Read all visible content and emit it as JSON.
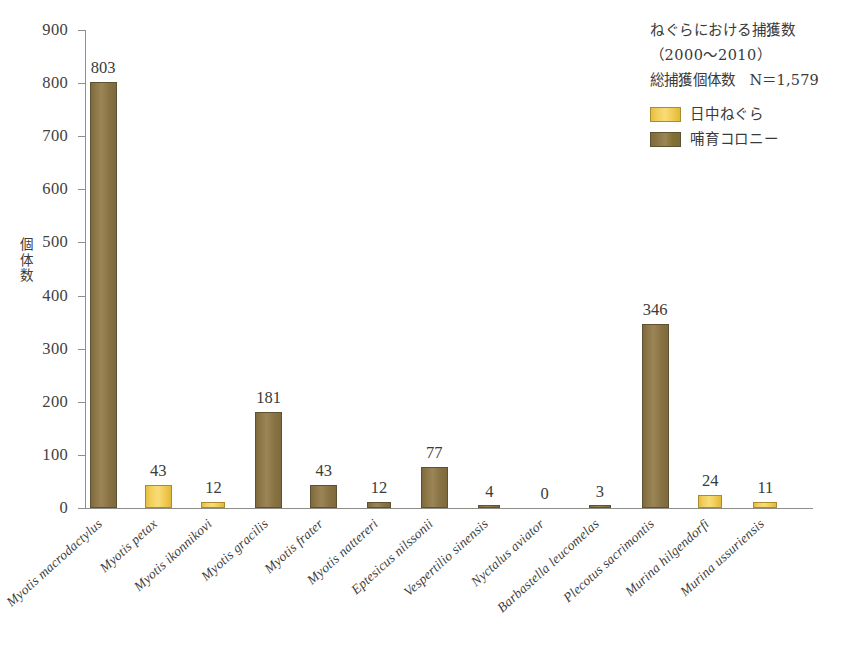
{
  "chart_data": {
    "type": "bar",
    "title": "",
    "xlabel": "",
    "ylabel": "個体数",
    "ylim": [
      0,
      900
    ],
    "ytick_step": 100,
    "yticks": [
      900,
      800,
      700,
      600,
      500,
      400,
      300,
      200,
      100,
      0
    ],
    "grid": false,
    "legend_position": "top-right",
    "categories": [
      "Myotis macrodactylus",
      "Myotis petax",
      "Myotis ikonnikovi",
      "Myotis gracilis",
      "Myotis frater",
      "Myotis nattereri",
      "Eptesicus nilssonii",
      "Vespertilio sinensis",
      "Nyctalus aviator",
      "Barbastella leucomelas",
      "Plecotus sacrimontis",
      "Murina hilgendorfi",
      "Murina ussuriensis"
    ],
    "values": [
      803,
      43,
      12,
      181,
      43,
      12,
      77,
      4,
      0,
      3,
      346,
      24,
      11
    ],
    "roost_type": [
      "nursery-colony",
      "day-roost",
      "day-roost",
      "nursery-colony",
      "nursery-colony",
      "nursery-colony",
      "nursery-colony",
      "nursery-colony",
      "none",
      "nursery-colony",
      "nursery-colony",
      "day-roost",
      "day-roost"
    ],
    "annotations": [
      "ねぐらにおける捕獲数",
      "（2000〜2010）",
      "総捕獲個体数　N＝1,579"
    ],
    "legend": [
      {
        "label": "日中ねぐら",
        "key": "day-roost",
        "color": "#f2cc52"
      },
      {
        "label": "哺育コロニー",
        "key": "nursery-colony",
        "color": "#8a7442"
      }
    ],
    "total_n": "1,579"
  },
  "colors": {
    "day_roost": "#f2cc52",
    "nursery_colony": "#8a7442",
    "axis": "#8d8d8a",
    "text": "#3a3a38",
    "background": "#ffffff"
  }
}
